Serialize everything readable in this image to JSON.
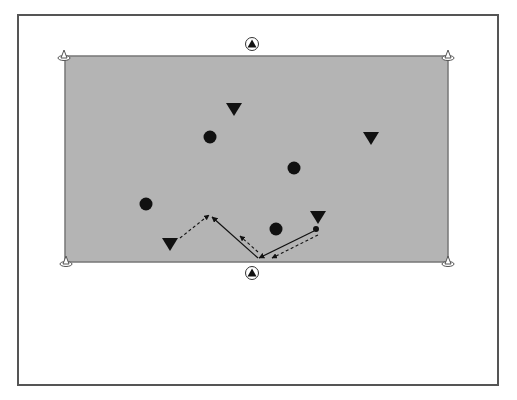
{
  "diagram": {
    "type": "soccer-drill",
    "colors": {
      "field": "#b4b4b4",
      "field_border": "#777777",
      "frame": "#555555",
      "marker": "#111111",
      "background": "#ffffff"
    },
    "field": {
      "x": 65,
      "y": 56,
      "width": 383,
      "height": 206
    },
    "cones": [
      {
        "name": "cone-top-left",
        "x": 64,
        "y": 56
      },
      {
        "name": "cone-top-right",
        "x": 448,
        "y": 56
      },
      {
        "name": "cone-bottom-left",
        "x": 66,
        "y": 262
      },
      {
        "name": "cone-bottom-right",
        "x": 448,
        "y": 262
      }
    ],
    "goal_markers": [
      {
        "name": "goal-marker-top",
        "x": 252,
        "y": 44
      },
      {
        "name": "goal-marker-bottom",
        "x": 252,
        "y": 273
      }
    ],
    "triangle_players": [
      {
        "x": 234,
        "y": 109
      },
      {
        "x": 371,
        "y": 138
      },
      {
        "x": 170,
        "y": 244
      },
      {
        "x": 318,
        "y": 217
      }
    ],
    "circle_players": [
      {
        "x": 210,
        "y": 137
      },
      {
        "x": 294,
        "y": 168
      },
      {
        "x": 146,
        "y": 204
      },
      {
        "x": 276,
        "y": 229
      }
    ],
    "ball": {
      "x": 316,
      "y": 229
    },
    "arrows": [
      {
        "style": "dashed",
        "x1": 180,
        "y1": 238,
        "x2": 209,
        "y2": 215
      },
      {
        "style": "solid",
        "x1": 258,
        "y1": 258,
        "x2": 212,
        "y2": 217
      },
      {
        "style": "dashed",
        "x1": 258,
        "y1": 252,
        "x2": 240,
        "y2": 236
      },
      {
        "style": "solid",
        "x1": 314,
        "y1": 231,
        "x2": 259,
        "y2": 258
      },
      {
        "style": "dashed",
        "x1": 318,
        "y1": 235,
        "x2": 272,
        "y2": 258
      }
    ]
  }
}
